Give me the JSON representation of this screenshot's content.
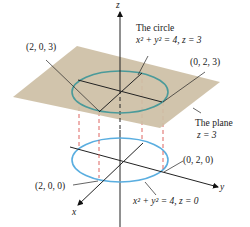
{
  "diagram": {
    "axes": {
      "x": "x",
      "y": "y",
      "z": "z"
    },
    "upper_circle": {
      "title": "The circle",
      "equation": "x² + y² = 4,  z = 3",
      "color": "#4a9a9a"
    },
    "lower_circle": {
      "equation": "x² + y² = 4, z = 0",
      "color": "#5aaee0"
    },
    "plane": {
      "title": "The plane",
      "equation": "z = 3",
      "color": "#cdbfa5"
    },
    "points": {
      "p_203": "(2, 0, 3)",
      "p_023": "(0, 2, 3)",
      "p_200": "(2, 0, 0)",
      "p_020": "(0, 2, 0)"
    },
    "dashed_color": "#d9534f"
  }
}
